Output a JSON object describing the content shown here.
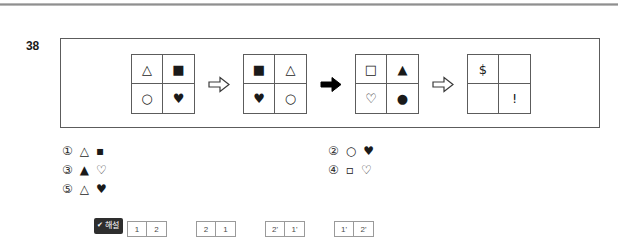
{
  "page": {
    "question_number": "38",
    "top_rule": true
  },
  "problem": {
    "grids": [
      {
        "name": "grid-1",
        "cells": [
          {
            "glyph": "△",
            "name": "triangle-outline"
          },
          {
            "glyph": "■",
            "name": "square-filled"
          },
          {
            "glyph": "○",
            "name": "circle-outline"
          },
          {
            "glyph": "♥",
            "name": "heart-filled"
          }
        ]
      },
      {
        "name": "grid-2",
        "cells": [
          {
            "glyph": "■",
            "name": "square-filled"
          },
          {
            "glyph": "△",
            "name": "triangle-outline"
          },
          {
            "glyph": "♥",
            "name": "heart-filled"
          },
          {
            "glyph": "○",
            "name": "circle-outline"
          }
        ]
      },
      {
        "name": "grid-3",
        "cells": [
          {
            "glyph": "□",
            "name": "square-outline"
          },
          {
            "glyph": "▲",
            "name": "triangle-filled"
          },
          {
            "glyph": "♡",
            "name": "heart-outline"
          },
          {
            "glyph": "●",
            "name": "circle-filled"
          }
        ]
      },
      {
        "name": "grid-4",
        "cells": [
          {
            "glyph": "$",
            "name": "dollar-sign"
          },
          {
            "glyph": "",
            "name": "empty-cell"
          },
          {
            "glyph": "",
            "name": "empty-cell"
          },
          {
            "glyph": "!",
            "name": "exclamation-mark"
          }
        ]
      }
    ],
    "arrows": [
      {
        "name": "arrow-hollow-1",
        "style": "hollow"
      },
      {
        "name": "arrow-solid-1",
        "style": "solid"
      },
      {
        "name": "arrow-hollow-2",
        "style": "hollow"
      }
    ]
  },
  "options": [
    {
      "num": "①",
      "shapes": [
        "△",
        "▪"
      ],
      "names": [
        "triangle-outline",
        "square-filled-small"
      ]
    },
    {
      "num": "②",
      "shapes": [
        "○",
        "♥"
      ],
      "names": [
        "circle-outline",
        "heart-filled"
      ]
    },
    {
      "num": "③",
      "shapes": [
        "▲",
        "♡"
      ],
      "names": [
        "triangle-filled",
        "heart-outline"
      ]
    },
    {
      "num": "④",
      "shapes": [
        "▫",
        "♡"
      ],
      "names": [
        "square-outline-small",
        "heart-outline"
      ]
    },
    {
      "num": "⑤",
      "shapes": [
        "△",
        "♥"
      ],
      "names": [
        "triangle-outline",
        "heart-filled"
      ]
    }
  ],
  "explanation": {
    "badge_check": "✔",
    "badge_label": "해설",
    "mini_pairs": [
      {
        "name": "mini-pair-1",
        "left": "1",
        "right": "2"
      },
      {
        "name": "mini-pair-2",
        "left": "2",
        "right": "1"
      },
      {
        "name": "mini-pair-3",
        "left": "2'",
        "right": "1'"
      },
      {
        "name": "mini-pair-4",
        "left": "1'",
        "right": "2'"
      }
    ]
  }
}
